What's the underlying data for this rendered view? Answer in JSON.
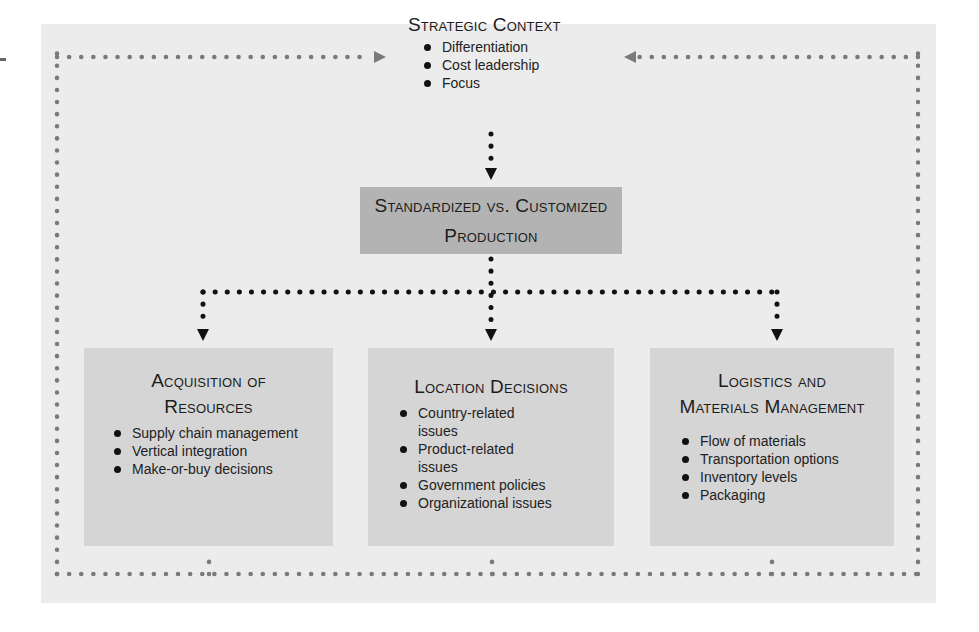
{
  "diagram": {
    "strategic_context": {
      "title": "Strategic Context",
      "items": [
        "Differentiation",
        "Cost leadership",
        "Focus"
      ]
    },
    "production": {
      "title_line1": "Standardized vs. Customized",
      "title_line2": "Production"
    },
    "boxes": [
      {
        "title_line1": "Acquisition of",
        "title_line2": "Resources",
        "items": [
          "Supply chain management",
          "Vertical integration",
          "Make-or-buy decisions"
        ]
      },
      {
        "title_line1": "Location Decisions",
        "items": [
          "Country-related issues",
          "Product-related issues",
          "Government policies",
          "Organizational issues"
        ]
      },
      {
        "title_line1": "Logistics and",
        "title_line2": "Materials Management",
        "items": [
          "Flow of materials",
          "Transportation options",
          "Inventory levels",
          "Packaging"
        ]
      }
    ],
    "colors": {
      "panel_bg": "#ececec",
      "production_box": "#b3b3b3",
      "decision_box": "#d5d5d5",
      "feedback_dots": "#7a7a7a",
      "flow_dots": "#111111"
    }
  }
}
